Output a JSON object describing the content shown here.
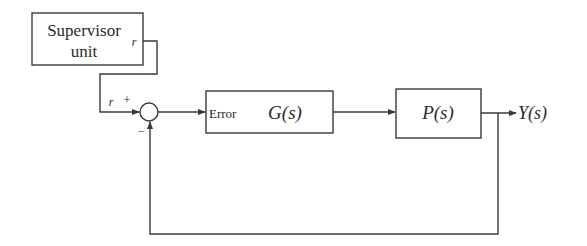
{
  "diagram": {
    "type": "feedback-control-block-diagram",
    "blocks": {
      "supervisor": {
        "line1": "Supervisor",
        "line2": "unit",
        "output_label": "r"
      },
      "controller": {
        "input_label": "Error",
        "label": "G(s)"
      },
      "plant": {
        "label": "P(s)"
      }
    },
    "summing_junction": {
      "input_label": "r",
      "plus_sign": "+",
      "minus_sign": "–"
    },
    "output": {
      "label": "Y(s)"
    },
    "colors": {
      "line": "#3a3a3a",
      "text": "#2a2a2a",
      "background": "#ffffff"
    }
  }
}
